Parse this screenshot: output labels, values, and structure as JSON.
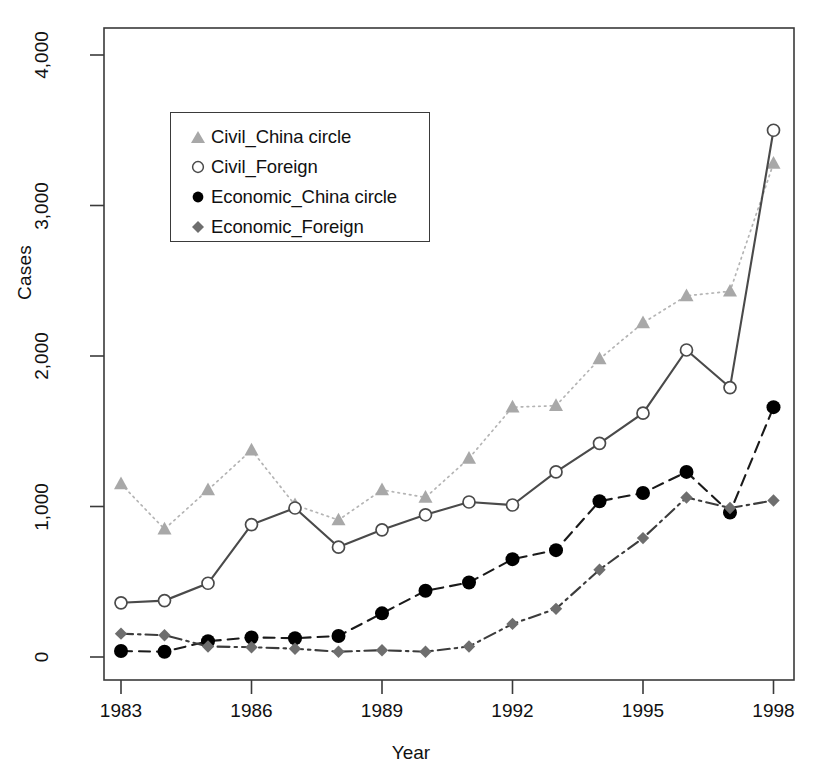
{
  "chart_data": {
    "type": "line",
    "title": "",
    "subtitle": "",
    "xlabel": "Year",
    "ylabel": "Cases",
    "grid": false,
    "legend_position": "upper-left-inside",
    "x": [
      1983,
      1984,
      1985,
      1986,
      1987,
      1988,
      1989,
      1990,
      1991,
      1992,
      1993,
      1994,
      1995,
      1996,
      1997,
      1998
    ],
    "xlim": [
      1982.3,
      1998.7
    ],
    "ylim": [
      -120,
      4150
    ],
    "xticks": [
      1983,
      1986,
      1989,
      1992,
      1995,
      1998
    ],
    "xtick_labels": [
      "1983",
      "1986",
      "1989",
      "1992",
      "1995",
      "1998"
    ],
    "yticks": [
      0,
      1000,
      2000,
      3000,
      4000
    ],
    "ytick_labels": [
      "0",
      "1,000",
      "2,000",
      "3,000",
      "4,000"
    ],
    "series": [
      {
        "name": "Civil_China circle",
        "marker": "triangle",
        "marker_fill": "#a8a8a8",
        "line_style": "dotted",
        "line_color": "#b4b4b4",
        "values": [
          1150,
          850,
          1110,
          1375,
          1010,
          910,
          1110,
          1060,
          1320,
          1660,
          1670,
          1980,
          2220,
          2400,
          2430,
          3280
        ]
      },
      {
        "name": "Civil_Foreign",
        "marker": "open-circle",
        "marker_fill": "#ffffff",
        "line_style": "solid",
        "line_color": "#4a4a4a",
        "values": [
          360,
          375,
          490,
          880,
          990,
          730,
          845,
          945,
          1030,
          1010,
          1230,
          1420,
          1620,
          2040,
          1790,
          3500
        ]
      },
      {
        "name": "Economic_China circle",
        "marker": "filled-circle",
        "marker_fill": "#000000",
        "line_style": "dashed",
        "line_color": "#1a1a1a",
        "values": [
          40,
          35,
          105,
          130,
          125,
          140,
          290,
          440,
          495,
          650,
          710,
          1035,
          1090,
          1230,
          960,
          1660
        ]
      },
      {
        "name": "Economic_Foreign",
        "marker": "diamond",
        "marker_fill": "#6e6e6e",
        "line_style": "dashdot",
        "line_color": "#3c3c3c",
        "values": [
          155,
          145,
          70,
          65,
          55,
          35,
          45,
          35,
          70,
          220,
          320,
          580,
          790,
          1060,
          990,
          1040
        ]
      }
    ]
  },
  "legend": {
    "items": [
      {
        "label": "Civil_China circle"
      },
      {
        "label": "Civil_Foreign"
      },
      {
        "label": "Economic_China circle"
      },
      {
        "label": "Economic_Foreign"
      }
    ]
  },
  "axes": {
    "x_title": "Year",
    "y_title": "Cases"
  }
}
